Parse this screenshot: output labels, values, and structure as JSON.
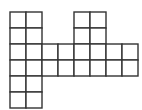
{
  "diagram": {
    "type": "grid-polyomino",
    "origin": [
      10,
      12
    ],
    "cell_size": 16,
    "stroke_color": "#333333",
    "fill_color": "#ffffff",
    "stroke_width": 1.4,
    "cells": [
      [
        0,
        0
      ],
      [
        1,
        0
      ],
      [
        4,
        0
      ],
      [
        5,
        0
      ],
      [
        0,
        1
      ],
      [
        1,
        1
      ],
      [
        4,
        1
      ],
      [
        5,
        1
      ],
      [
        0,
        2
      ],
      [
        1,
        2
      ],
      [
        2,
        2
      ],
      [
        3,
        2
      ],
      [
        4,
        2
      ],
      [
        5,
        2
      ],
      [
        6,
        2
      ],
      [
        7,
        2
      ],
      [
        0,
        3
      ],
      [
        1,
        3
      ],
      [
        2,
        3
      ],
      [
        3,
        3
      ],
      [
        4,
        3
      ],
      [
        5,
        3
      ],
      [
        6,
        3
      ],
      [
        7,
        3
      ],
      [
        0,
        4
      ],
      [
        1,
        4
      ],
      [
        0,
        5
      ],
      [
        1,
        5
      ]
    ]
  }
}
